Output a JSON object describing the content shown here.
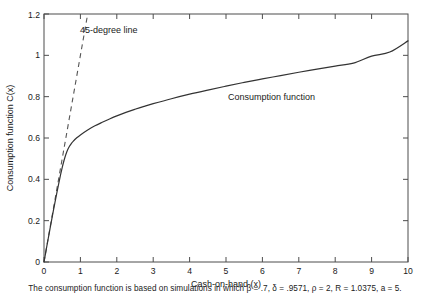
{
  "chart_data": {
    "type": "line",
    "title": "",
    "xlabel": "Cash-on-hand (x)",
    "ylabel": "Consumption function C(x)",
    "xlim": [
      0,
      10
    ],
    "ylim": [
      0,
      1.2
    ],
    "xticks": [
      "0",
      "1",
      "2",
      "3",
      "4",
      "5",
      "6",
      "7",
      "8",
      "9",
      "10"
    ],
    "xtick_values": [
      0,
      1,
      2,
      3,
      4,
      5,
      6,
      7,
      8,
      9,
      10
    ],
    "yticks": [
      "0",
      "0.2",
      "0.4",
      "0.6",
      "0.8",
      "1",
      "1.2"
    ],
    "ytick_values": [
      0,
      0.2,
      0.4,
      0.6,
      0.8,
      1,
      1.2
    ],
    "grid": false,
    "legend": "none",
    "series": [
      {
        "name": "Consumption function",
        "style": "solid",
        "color": "#333333",
        "x": [
          0,
          0.05,
          0.1,
          0.15,
          0.2,
          0.25,
          0.3,
          0.35,
          0.4,
          0.45,
          0.5,
          0.55,
          0.6,
          0.65,
          0.7,
          0.75,
          0.8,
          0.9,
          1.0,
          1.2,
          1.4,
          1.6,
          1.8,
          2.0,
          2.25,
          2.5,
          2.75,
          3.0,
          3.5,
          4.0,
          4.5,
          5.0,
          5.5,
          6.0,
          6.5,
          7.0,
          7.5,
          8.0,
          8.5,
          9.0,
          9.5,
          10.0
        ],
        "y": [
          0.0,
          0.049,
          0.098,
          0.146,
          0.194,
          0.241,
          0.287,
          0.332,
          0.376,
          0.418,
          0.457,
          0.491,
          0.52,
          0.543,
          0.56,
          0.573,
          0.584,
          0.601,
          0.615,
          0.639,
          0.659,
          0.676,
          0.692,
          0.707,
          0.724,
          0.739,
          0.753,
          0.766,
          0.79,
          0.812,
          0.832,
          0.851,
          0.869,
          0.886,
          0.902,
          0.918,
          0.933,
          0.948,
          0.962,
          0.996,
          1.016,
          1.07
        ]
      },
      {
        "name": "45-degree line",
        "style": "dashed",
        "color": "#555555",
        "x": [
          0,
          1.2
        ],
        "y": [
          0,
          1.2
        ]
      }
    ],
    "annotations": [
      {
        "text": "45-degree line",
        "x": 1.0,
        "y": 1.105
      },
      {
        "text": "Consumption function",
        "x": 5.05,
        "y": 0.79
      }
    ]
  },
  "caption": {
    "text": "The consumption function is based on simulations in which β = .7, δ = .9571, ρ = 2, R = 1.0375, a = 5."
  }
}
